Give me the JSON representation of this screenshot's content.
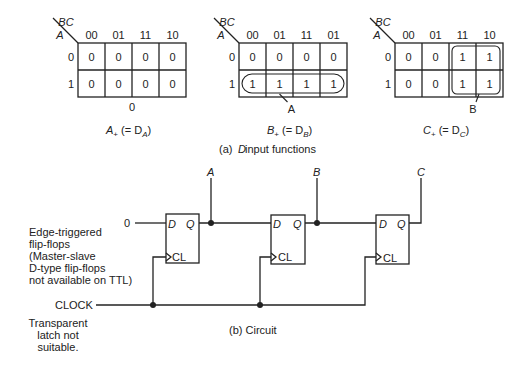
{
  "kmaps": [
    {
      "var_col": "BC",
      "var_row": "A",
      "cols": [
        "00",
        "01",
        "11",
        "10"
      ],
      "rows": [
        "0",
        "1"
      ],
      "cells": [
        [
          "0",
          "0",
          "0",
          "0"
        ],
        [
          "0",
          "0",
          "0",
          "0"
        ]
      ],
      "group_label": "0",
      "title_main": "A",
      "title_sub": "+",
      "title_rest": " (= D",
      "title_rest_sub": "A",
      "title_close": ")"
    },
    {
      "var_col": "BC",
      "var_row": "A",
      "cols": [
        "00",
        "01",
        "11",
        "01"
      ],
      "rows": [
        "0",
        "1"
      ],
      "cells": [
        [
          "0",
          "0",
          "0",
          "0"
        ],
        [
          "1",
          "1",
          "1",
          "1"
        ]
      ],
      "group_label": "A",
      "title_main": "B",
      "title_sub": "+",
      "title_rest": " (= D",
      "title_rest_sub": "B",
      "title_close": ")"
    },
    {
      "var_col": "BC",
      "var_row": "A",
      "cols": [
        "00",
        "01",
        "11",
        "10"
      ],
      "rows": [
        "0",
        "1"
      ],
      "cells": [
        [
          "0",
          "0",
          "1",
          "1"
        ],
        [
          "0",
          "0",
          "1",
          "1"
        ]
      ],
      "group_label": "B",
      "title_main": "C",
      "title_sub": "+",
      "title_rest": " (= D",
      "title_rest_sub": "C",
      "title_close": ")"
    }
  ],
  "caption_a_prefix": "(a)",
  "caption_a_d": "D",
  "caption_a_rest": " input functions",
  "circuit": {
    "input_zero": "0",
    "outputs": [
      "A",
      "B",
      "C"
    ],
    "ff_d": "D",
    "ff_q": "Q",
    "ff_cl": "CL",
    "clock_label": "CLOCK",
    "note_edge": [
      "Edge-triggered",
      "flip-flops",
      "(Master-slave",
      "D-type flip-flops",
      "not available on TTL)"
    ],
    "note_latch": [
      "Transparent",
      "latch not",
      "suitable."
    ]
  },
  "caption_b": "(b)  Circuit"
}
